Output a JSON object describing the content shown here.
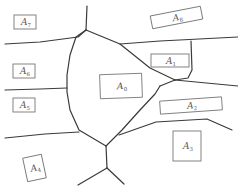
{
  "diagram": {
    "type": "region-partition",
    "line_color": "#3a3a3a",
    "box_color": "#777777",
    "regions": [
      {
        "id": "A0",
        "base": "A",
        "sub": "0",
        "x": 100,
        "y": 74,
        "w": 42,
        "h": 24,
        "rot": -2
      },
      {
        "id": "A1",
        "base": "A",
        "sub": "1",
        "x": 151,
        "y": 54,
        "w": 38,
        "h": 13,
        "rot": 0
      },
      {
        "id": "A2",
        "base": "A",
        "sub": "2",
        "x": 160,
        "y": 99,
        "w": 62,
        "h": 13,
        "rot": -4
      },
      {
        "id": "A3",
        "base": "A",
        "sub": "3",
        "x": 173,
        "y": 131,
        "w": 28,
        "h": 30,
        "rot": 0
      },
      {
        "id": "A4",
        "base": "A",
        "sub": "4",
        "x": 25,
        "y": 156,
        "w": 19,
        "h": 24,
        "rot": -12
      },
      {
        "id": "A5",
        "base": "A",
        "sub": "5",
        "x": 13,
        "y": 98,
        "w": 22,
        "h": 14,
        "rot": 0
      },
      {
        "id": "A6",
        "base": "A",
        "sub": "6",
        "x": 13,
        "y": 64,
        "w": 22,
        "h": 14,
        "rot": 0
      },
      {
        "id": "A7",
        "base": "A",
        "sub": "7",
        "x": 14,
        "y": 15,
        "w": 22,
        "h": 14,
        "rot": 0
      },
      {
        "id": "A8",
        "base": "A",
        "sub": "8",
        "x": 151,
        "y": 11,
        "w": 51,
        "h": 13,
        "rot": -11
      }
    ],
    "footer_text": ""
  }
}
